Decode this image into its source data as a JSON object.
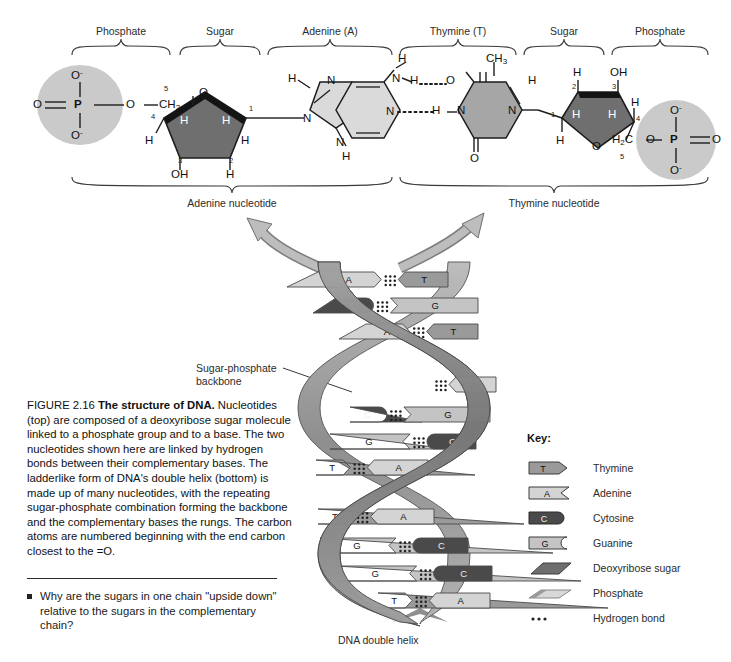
{
  "figure": {
    "number": "FIGURE 2.16",
    "title": "The structure of DNA.",
    "caption": "Nucleotides (top) are composed of a deoxyribose sugar molecule linked to a phosphate group and to a base. The two nucleotides shown here are linked by hydrogen bonds between their complementary bases. The ladderlike form of DNA's double helix (bottom) is made up of many nucleotides, with the repeating sugar-phosphate combination forming the backbone and the complementary bases the rungs. The carbon atoms are numbered beginning with the end carbon closest to the =O.",
    "question": "Why are the sugars in one chain \"upside down\" relative to the sugars in the complementary chain?"
  },
  "top_brackets": [
    {
      "label": "Phosphate",
      "x": 72,
      "w": 98
    },
    {
      "label": "Sugar",
      "x": 180,
      "w": 80
    },
    {
      "label": "Adenine (A)",
      "x": 268,
      "w": 124
    },
    {
      "label": "Thymine (T)",
      "x": 400,
      "w": 116
    },
    {
      "label": "Sugar",
      "x": 524,
      "w": 80
    },
    {
      "label": "Phosphate",
      "x": 612,
      "w": 96
    }
  ],
  "bottom_brackets": [
    {
      "label": "Adenine nucleotide",
      "x": 72,
      "w": 320
    },
    {
      "label": "Thymine nucleotide",
      "x": 400,
      "w": 308
    }
  ],
  "atoms": {
    "left_phosphate": {
      "top_o": "O",
      "top_charge": "-",
      "left_o": "O",
      "p": "P",
      "bottom_o": "O",
      "bottom_charge": "-",
      "bridge_o": "O",
      "ch2": "CH",
      "ch2_sub": "2"
    },
    "left_sugar": {
      "ring_o": "O",
      "c5": "5",
      "c4": "4",
      "c3": "3",
      "c2": "2",
      "c1": "1",
      "h_inner_left": "H",
      "h_inner_right": "H",
      "h_out_left": "H",
      "h_out_right": "H",
      "oh": "OH",
      "h_bottom": "H"
    },
    "adenine": {
      "h_left": "H",
      "n_top": "N",
      "n_bottom": "N",
      "n_ring": "N",
      "n_right": "N",
      "h_bottom": "H",
      "amine_n": "N",
      "amine_h_top": "H",
      "amine_h_right": "H"
    },
    "thymine": {
      "ch3": "CH",
      "ch3_sub": "3",
      "o_top": "O",
      "o_bottom": "O",
      "n_left": "N",
      "n_right": "N",
      "h_right": "H",
      "h_bond_h": "H"
    },
    "right_sugar": {
      "ring_o": "O",
      "c1": "1",
      "c2": "2",
      "c3": "3",
      "c4": "4",
      "c5": "5",
      "h_top_left": "H",
      "oh": "OH",
      "h_right": "H",
      "h_inner_left": "H",
      "h_inner_right": "H",
      "h_bottom_left": "H",
      "ch2": "H",
      "ch2_sub": "2",
      "ch2_c": "C"
    },
    "right_phosphate": {
      "top_o": "O",
      "top_charge": "-",
      "bridge_o": "O",
      "p": "P",
      "right_o": "O",
      "bottom_o": "O",
      "bottom_charge": "-"
    }
  },
  "helix": {
    "label": "DNA double helix",
    "backbone_label_line1": "Sugar-phosphate",
    "backbone_label_line2": "backbone",
    "rungs": [
      {
        "left": "A",
        "right": "T",
        "y": 272,
        "x": 318,
        "w": 130,
        "split": 0.56
      },
      {
        "left": "C",
        "right": "G",
        "y": 298,
        "x": 336,
        "w": 142,
        "split": 0.3
      },
      {
        "left": "A",
        "right": "T",
        "y": 324,
        "x": 366,
        "w": 112,
        "split": 0.46
      },
      {
        "left": "",
        "right": "A",
        "y": 377,
        "x": 398,
        "w": 98,
        "split": 0.42
      },
      {
        "left": "C",
        "right": "G",
        "y": 407,
        "x": 350,
        "w": 140,
        "split": 0.3
      },
      {
        "left": "G",
        "right": "C",
        "y": 434,
        "x": 330,
        "w": 146,
        "split": 0.62
      },
      {
        "left": "T",
        "right": "A",
        "y": 460,
        "x": 316,
        "w": 112,
        "split": 0.36
      },
      {
        "left": "T",
        "right": "A",
        "y": 509,
        "x": 318,
        "w": 116,
        "split": 0.36
      },
      {
        "left": "G",
        "right": "C",
        "y": 538,
        "x": 320,
        "w": 148,
        "split": 0.58
      },
      {
        "left": "G",
        "right": "C",
        "y": 566,
        "x": 336,
        "w": 156,
        "split": 0.58
      },
      {
        "left": "T",
        "right": "A",
        "y": 593,
        "x": 378,
        "w": 112,
        "split": 0.36
      }
    ]
  },
  "key": {
    "title": "Key:",
    "items": [
      {
        "symbol": "thymine-glyph",
        "label": "Thymine"
      },
      {
        "symbol": "adenine-glyph",
        "label": "Adenine"
      },
      {
        "symbol": "cytosine-glyph",
        "label": "Cytosine"
      },
      {
        "symbol": "guanine-glyph",
        "label": "Guanine"
      },
      {
        "symbol": "sugar-glyph",
        "label": "Deoxyribose sugar"
      },
      {
        "symbol": "phosphate-glyph",
        "label": "Phosphate"
      },
      {
        "symbol": "hbond-glyph",
        "label": "Hydrogen bond"
      }
    ],
    "letters": {
      "T": "T",
      "A": "A",
      "C": "C",
      "G": "G"
    }
  },
  "colors": {
    "thymine": "#9a9a9a",
    "adenine": "#d4d4d4",
    "cytosine": "#4a4a4a",
    "guanine": "#c4c4c4",
    "sugar_dark": "#6e6e6e",
    "sugar_ring": "#7a7a7a",
    "phosphate_circle": "#c9c9c9",
    "purine_ring": "#d8d8d8",
    "pyrimidine_ring": "#a5a5a5",
    "backbone": "#8d8d8d",
    "backbone_dark": "#6a6a6a",
    "arrow": "#b5b5b5",
    "ink": "#1d1d1d"
  }
}
